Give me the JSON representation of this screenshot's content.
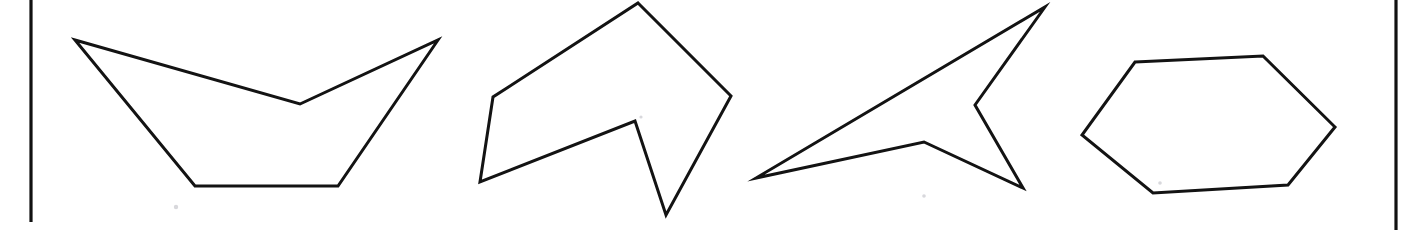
{
  "figure": {
    "background_color": "#ffffff",
    "ink_color": "#131313",
    "rule_color": "#111111",
    "canvas": {
      "width": 1406,
      "height": 230
    },
    "stroke_width": 3
  },
  "rules": [
    {
      "name": "left-page-rule",
      "x1": 31,
      "y1": 0,
      "x2": 31,
      "y2": 222
    },
    {
      "name": "right-page-rule",
      "x1": 1396,
      "y1": 0,
      "x2": 1396,
      "y2": 230
    }
  ],
  "specks": [
    {
      "cx": 176,
      "cy": 207,
      "r": 2.2
    },
    {
      "cx": 924,
      "cy": 196,
      "r": 1.8
    },
    {
      "cx": 1160,
      "cy": 183,
      "r": 1.8
    },
    {
      "cx": 641,
      "cy": 117,
      "r": 1.6
    }
  ],
  "shapes": [
    {
      "id": "shape-1",
      "name": "concave-boat-pentagon",
      "vertex_count": 5,
      "convex": false,
      "points": "75,40 300,104 438,40 338,186 195,186",
      "vertices": [
        {
          "x": 75,
          "y": 40,
          "label": "left-upper-tip"
        },
        {
          "x": 300,
          "y": 104,
          "label": "top-notch"
        },
        {
          "x": 438,
          "y": 40,
          "label": "right-upper-tip"
        },
        {
          "x": 338,
          "y": 186,
          "label": "bottom-right"
        },
        {
          "x": 195,
          "y": 186,
          "label": "bottom-left"
        }
      ]
    },
    {
      "id": "shape-2",
      "name": "concave-arrowhead-hexagon",
      "vertex_count": 6,
      "convex": false,
      "points": "638,3 731,96 666,215 635,121 480,182 493,97",
      "vertices": [
        {
          "x": 638,
          "y": 3,
          "label": "top-peak"
        },
        {
          "x": 731,
          "y": 96,
          "label": "right-corner"
        },
        {
          "x": 666,
          "y": 215,
          "label": "bottom-spike"
        },
        {
          "x": 635,
          "y": 121,
          "label": "inner-notch"
        },
        {
          "x": 480,
          "y": 182,
          "label": "left-bottom-tip"
        },
        {
          "x": 493,
          "y": 97,
          "label": "left-shoulder"
        }
      ]
    },
    {
      "id": "shape-3",
      "name": "concave-dart-pentagon",
      "vertex_count": 5,
      "convex": false,
      "points": "1045,7 975,105 1023,188 924,142 756,178",
      "vertices": [
        {
          "x": 1045,
          "y": 7,
          "label": "upper-right-tip"
        },
        {
          "x": 975,
          "y": 105,
          "label": "right-notch"
        },
        {
          "x": 1023,
          "y": 188,
          "label": "lower-right-tip"
        },
        {
          "x": 924,
          "y": 142,
          "label": "center-notch"
        },
        {
          "x": 756,
          "y": 178,
          "label": "left-tip"
        }
      ]
    },
    {
      "id": "shape-4",
      "name": "convex-hexagon",
      "vertex_count": 6,
      "convex": true,
      "points": "1135,62 1263,56 1335,127 1288,185 1153,193 1082,135",
      "vertices": [
        {
          "x": 1135,
          "y": 62,
          "label": "top-left"
        },
        {
          "x": 1263,
          "y": 56,
          "label": "top-right"
        },
        {
          "x": 1335,
          "y": 127,
          "label": "right"
        },
        {
          "x": 1288,
          "y": 185,
          "label": "bottom-right"
        },
        {
          "x": 1153,
          "y": 193,
          "label": "bottom-left"
        },
        {
          "x": 1082,
          "y": 135,
          "label": "left"
        }
      ]
    }
  ]
}
